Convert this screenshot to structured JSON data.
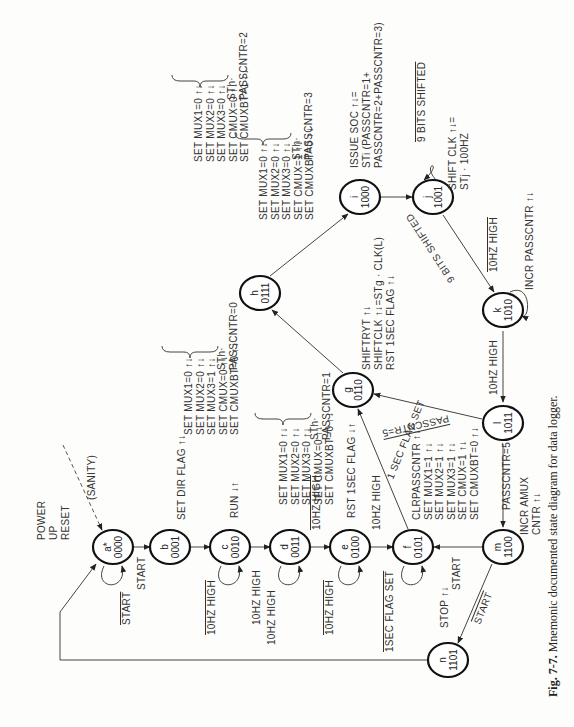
{
  "caption": {
    "fig": "Fig. 7-7.",
    "text": "Mnemonic documented state diagram for data logger."
  },
  "nodes": [
    {
      "id": "a",
      "label": "a*",
      "code": "0000",
      "x": 113,
      "y": 547
    },
    {
      "id": "b",
      "label": "b",
      "code": "0001",
      "x": 170,
      "y": 547
    },
    {
      "id": "c",
      "label": "c",
      "code": "0010",
      "x": 230,
      "y": 547
    },
    {
      "id": "d",
      "label": "d",
      "code": "0011",
      "x": 290,
      "y": 547
    },
    {
      "id": "e",
      "label": "e",
      "code": "0100",
      "x": 350,
      "y": 547
    },
    {
      "id": "f",
      "label": "f",
      "code": "0101",
      "x": 413,
      "y": 547
    },
    {
      "id": "m",
      "label": "m",
      "code": "1100",
      "x": 503,
      "y": 547
    },
    {
      "id": "n",
      "label": "n",
      "code": "1101",
      "x": 448,
      "y": 660
    },
    {
      "id": "g",
      "label": "g",
      "code": "0110",
      "x": 353,
      "y": 390
    },
    {
      "id": "h",
      "label": "h",
      "code": "0111",
      "x": 260,
      "y": 293
    },
    {
      "id": "i",
      "label": "i",
      "code": "1000",
      "x": 360,
      "y": 197
    },
    {
      "id": "j",
      "label": "j",
      "code": "1001",
      "x": 433,
      "y": 197
    },
    {
      "id": "k",
      "label": "k",
      "code": "1010",
      "x": 503,
      "y": 310
    },
    {
      "id": "l",
      "label": "l",
      "code": "1011",
      "x": 503,
      "y": 423
    }
  ],
  "labels": {
    "power_up": [
      "POWER",
      "UP",
      "RESET"
    ],
    "sanity": "(SANITY)",
    "a_self": "START",
    "a_b": "START",
    "b_out": "SET DIR FLAG ↑↓",
    "c_out": "RUN ↓↑",
    "c_self": "10HZ HIGH",
    "c_d": "10HZ HIGH",
    "d_self": "10HZ HIGH",
    "d_e": "10HZ HIGH",
    "e_out": "RST 1SEC FLAG ↓↑",
    "e_self": "10HZ HIGH",
    "e_f": "10HZ HIGH",
    "f_self": "1SEC FLAG SET",
    "f_g": "1 SEC FLAG SET",
    "m_f": "START",
    "m_n": "START",
    "n_out": "STOP ↑↓",
    "l_m": "PASSCNTR=5",
    "l_g": "PASSCNTR=5",
    "k_l": "10HZ HIGH",
    "k_self": "10HZ HIGH",
    "k_out": "INCR PASSCNTR ↑↓",
    "j_k": "9 BITS SHIFTED",
    "j_self": "9 BITS SHIFTED",
    "j_out": [
      "SHIFT CLK ↑↓=",
      "STj · 100HZ"
    ],
    "i_out": [
      "ISSUE SOC ↑↓=",
      "STi (PASSCNTR=1+",
      "PASSCNTR=2+PASSCNTR=3)"
    ],
    "g_out": [
      "SHIFTRYT ↑↓",
      "SHIFTCLK ↑↓=STg · CLK(L)",
      "RST 1SEC FLAG ↑↓"
    ],
    "m_out": [
      "INCR AMUX",
      "CNTR ↑↓"
    ],
    "f_block": [
      "CLRPASSCNTR ↑↓",
      "SET MUX1=1 ↑↓",
      "SET MUX2=1 ↑↓",
      "SET MUX3=1 ↑↓",
      "SET CMUX=1 ↑↓",
      "SET CMUXBT=0 ↑↓"
    ],
    "h_block1": [
      "SET MUX1=0 ↑↓",
      "SET MUX2=0 ↑↓",
      "SET MUX3=0 ↑↓",
      "SET CMUX=0 ↑↓",
      "SET CMUXBT=1 ↑↓"
    ],
    "h_cond1": [
      "STh·",
      "PASSCNTR=2"
    ],
    "h_block2": [
      "SET MUX1=0 ↑↓",
      "SET MUX2=0 ↑↓",
      "SET MUX3=0 ↑↓",
      "SET CMUX=1 ↑↓",
      "SET CMUXBT=0 ↑↓"
    ],
    "h_cond2": [
      "STh·",
      "PASSCNTR=3"
    ],
    "h_block0": [
      "SET MUX1=0 ↑↓",
      "SET MUX2=0 ↑↓",
      "SET MUX3=1 ↑↓",
      "SET CMUX=0 ↑↓",
      "SET CMUXBT=0 ↑↓"
    ],
    "h_cond0": [
      "STh·",
      "PASSCNTR=0"
    ],
    "d_block": [
      "SET MUX1=0 ↑↓",
      "SET MUX2=0 ↑↓",
      "SET MUX3=0 ↑↓",
      "SET CMUX=0 ↑↓",
      "SET CMUXBT=0 ↑↓"
    ],
    "d_cond": [
      "STh·",
      "PASSCNTR=1"
    ]
  }
}
